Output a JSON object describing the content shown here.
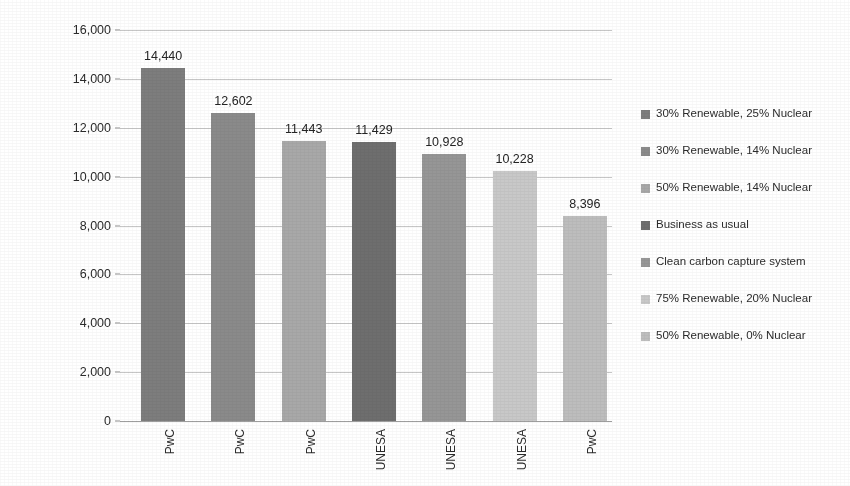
{
  "chart_data": {
    "type": "bar",
    "title": "",
    "xlabel": "",
    "ylabel": "Total water withdrawal and consumed per year (hm3)",
    "ylim": [
      0,
      16000
    ],
    "ytick_labels": [
      "0",
      "2,000",
      "4,000",
      "6,000",
      "8,000",
      "10,000",
      "12,000",
      "14,000",
      "16,000"
    ],
    "ytick_values": [
      0,
      2000,
      4000,
      6000,
      8000,
      10000,
      12000,
      14000,
      16000
    ],
    "grid": true,
    "legend_position": "right",
    "categories": [
      "PwC",
      "PwC",
      "PwC",
      "UNESA",
      "UNESA",
      "UNESA",
      "PwC"
    ],
    "values": [
      14440,
      12602,
      11443,
      11429,
      10928,
      10228,
      8396
    ],
    "value_labels": [
      "14,440",
      "12,602",
      "11,443",
      "11,429",
      "10,928",
      "10,228",
      "8,396"
    ],
    "bar_colors": [
      "#7d7d7d",
      "#8a8a8a",
      "#a8a8a8",
      "#6e6e6e",
      "#969696",
      "#c8c8c8",
      "#bdbdbd"
    ],
    "legend": [
      {
        "label": "30% Renewable, 25% Nuclear",
        "color": "#7d7d7d"
      },
      {
        "label": "30% Renewable, 14% Nuclear",
        "color": "#8a8a8a"
      },
      {
        "label": "50% Renewable, 14% Nuclear",
        "color": "#a8a8a8"
      },
      {
        "label": "Business as usual",
        "color": "#6e6e6e"
      },
      {
        "label": "Clean carbon capture system",
        "color": "#969696"
      },
      {
        "label": "75% Renewable, 20% Nuclear",
        "color": "#c8c8c8"
      },
      {
        "label": "50% Renewable, 0% Nuclear",
        "color": "#bdbdbd"
      }
    ]
  }
}
